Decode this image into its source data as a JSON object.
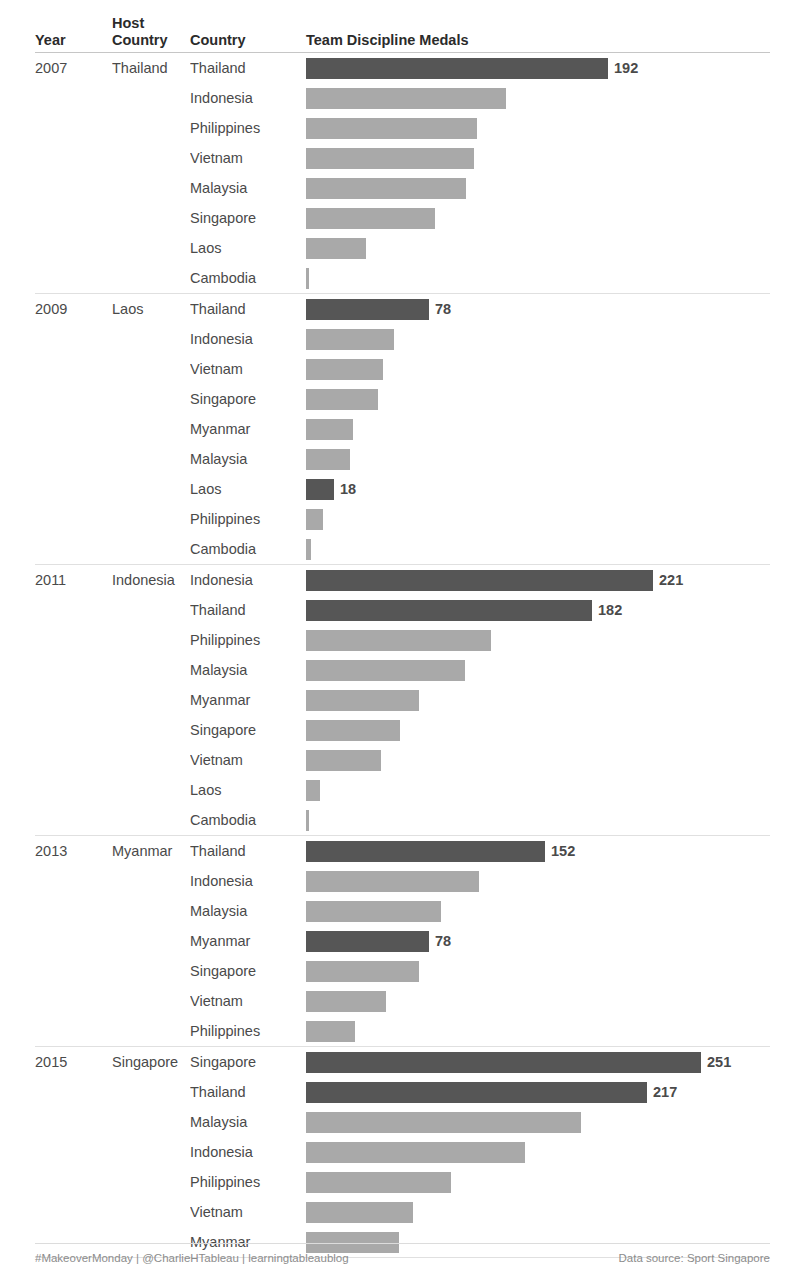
{
  "header": {
    "year": "Year",
    "host_country": "Host\nCountry",
    "country": "Country",
    "measure": "Team Discipline Medals"
  },
  "footer": {
    "credit": "#MakeoverMonday | @CharlieHTableau | learningtableaublog",
    "source": "Data source: Sport Singapore"
  },
  "style": {
    "bar_color": "#a9a9a9",
    "bar_highlight_color": "#565656",
    "text_color": "#4a4a4a",
    "rule_color": "#d6d6d6",
    "background": "#ffffff"
  },
  "chart_data": {
    "type": "bar",
    "title": "Team Discipline Medals",
    "xlabel": "Team Discipline Medals",
    "ylabel": "Country",
    "orientation": "horizontal",
    "grid": false,
    "legend": "none",
    "xlim": [
      0,
      260
    ],
    "px_per_unit": 1.572,
    "value_labels_shown_for": "host country rows only",
    "groups": [
      {
        "year": "2007",
        "host_country": "Thailand",
        "rows": [
          {
            "country": "Thailand",
            "value": 192,
            "highlight": true,
            "label": "192"
          },
          {
            "country": "Indonesia",
            "value": 127,
            "highlight": false,
            "label": ""
          },
          {
            "country": "Philippines",
            "value": 109,
            "highlight": false,
            "label": ""
          },
          {
            "country": "Vietnam",
            "value": 107,
            "highlight": false,
            "label": ""
          },
          {
            "country": "Malaysia",
            "value": 102,
            "highlight": false,
            "label": ""
          },
          {
            "country": "Singapore",
            "value": 82,
            "highlight": false,
            "label": ""
          },
          {
            "country": "Laos",
            "value": 38,
            "highlight": false,
            "label": ""
          },
          {
            "country": "Cambodia",
            "value": 2,
            "highlight": false,
            "label": ""
          }
        ]
      },
      {
        "year": "2009",
        "host_country": "Laos",
        "rows": [
          {
            "country": "Thailand",
            "value": 78,
            "highlight": true,
            "label": "78"
          },
          {
            "country": "Indonesia",
            "value": 56,
            "highlight": false,
            "label": ""
          },
          {
            "country": "Vietnam",
            "value": 49,
            "highlight": false,
            "label": ""
          },
          {
            "country": "Singapore",
            "value": 46,
            "highlight": false,
            "label": ""
          },
          {
            "country": "Myanmar",
            "value": 30,
            "highlight": false,
            "label": ""
          },
          {
            "country": "Malaysia",
            "value": 28,
            "highlight": false,
            "label": ""
          },
          {
            "country": "Laos",
            "value": 18,
            "highlight": true,
            "label": "18"
          },
          {
            "country": "Philippines",
            "value": 11,
            "highlight": false,
            "label": ""
          },
          {
            "country": "Cambodia",
            "value": 3,
            "highlight": false,
            "label": ""
          }
        ]
      },
      {
        "year": "2011",
        "host_country": "Indonesia",
        "rows": [
          {
            "country": "Indonesia",
            "value": 221,
            "highlight": true,
            "label": "221"
          },
          {
            "country": "Thailand",
            "value": 182,
            "highlight": true,
            "label": "182"
          },
          {
            "country": "Philippines",
            "value": 118,
            "highlight": false,
            "label": ""
          },
          {
            "country": "Malaysia",
            "value": 101,
            "highlight": false,
            "label": ""
          },
          {
            "country": "Myanmar",
            "value": 72,
            "highlight": false,
            "label": ""
          },
          {
            "country": "Singapore",
            "value": 60,
            "highlight": false,
            "label": ""
          },
          {
            "country": "Vietnam",
            "value": 48,
            "highlight": false,
            "label": ""
          },
          {
            "country": "Laos",
            "value": 9,
            "highlight": false,
            "label": ""
          },
          {
            "country": "Cambodia",
            "value": 2,
            "highlight": false,
            "label": ""
          }
        ]
      },
      {
        "year": "2013",
        "host_country": "Myanmar",
        "rows": [
          {
            "country": "Thailand",
            "value": 152,
            "highlight": true,
            "label": "152"
          },
          {
            "country": "Indonesia",
            "value": 110,
            "highlight": false,
            "label": ""
          },
          {
            "country": "Malaysia",
            "value": 86,
            "highlight": false,
            "label": ""
          },
          {
            "country": "Myanmar",
            "value": 78,
            "highlight": true,
            "label": "78"
          },
          {
            "country": "Singapore",
            "value": 72,
            "highlight": false,
            "label": ""
          },
          {
            "country": "Vietnam",
            "value": 51,
            "highlight": false,
            "label": ""
          },
          {
            "country": "Philippines",
            "value": 31,
            "highlight": false,
            "label": ""
          }
        ]
      },
      {
        "year": "2015",
        "host_country": "Singapore",
        "rows": [
          {
            "country": "Singapore",
            "value": 251,
            "highlight": true,
            "label": "251"
          },
          {
            "country": "Thailand",
            "value": 217,
            "highlight": true,
            "label": "217"
          },
          {
            "country": "Malaysia",
            "value": 175,
            "highlight": false,
            "label": ""
          },
          {
            "country": "Indonesia",
            "value": 139,
            "highlight": false,
            "label": ""
          },
          {
            "country": "Philippines",
            "value": 92,
            "highlight": false,
            "label": ""
          },
          {
            "country": "Vietnam",
            "value": 68,
            "highlight": false,
            "label": ""
          },
          {
            "country": "Myanmar",
            "value": 59,
            "highlight": false,
            "label": ""
          }
        ]
      }
    ]
  }
}
